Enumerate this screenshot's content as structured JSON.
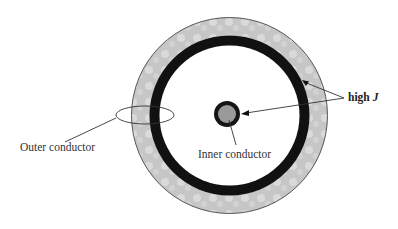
{
  "diagram": {
    "labels": {
      "outer_conductor": "Outer conductor",
      "inner_conductor": "Inner conductor",
      "high_j_prefix": "high ",
      "high_j_symbol": "J"
    },
    "colors": {
      "outer_conductor_fill": "#c9c9c9",
      "outer_conductor_edge": "#555555",
      "high_current_band": "#111111",
      "dielectric": "#ffffff",
      "inner_conductor_fill": "#9a9a9a",
      "inner_conductor_ring": "#151515",
      "leader_lines": "#333333"
    },
    "geometry": {
      "center": [
        229.5,
        115.5
      ],
      "outer_radius": 98,
      "black_band_outer_radius": 80,
      "black_band_inner_radius": 70,
      "inner_conductor_center": [
        227,
        114
      ],
      "inner_conductor_radius": 13,
      "inner_conductor_core_radius": 9
    }
  }
}
